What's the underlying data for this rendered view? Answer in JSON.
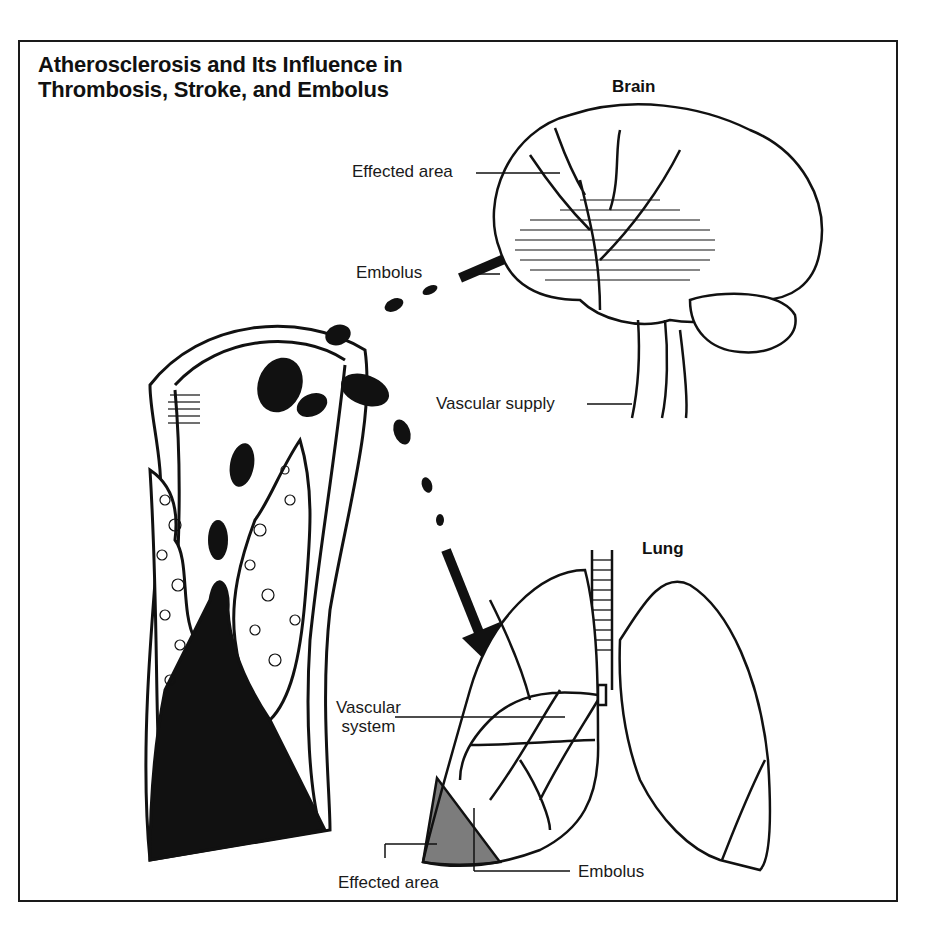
{
  "title": {
    "line1": "Atherosclerosis and Its Influence in",
    "line2": "Thrombosis, Stroke, and Embolus"
  },
  "brain": {
    "heading": "Brain",
    "labels": {
      "effected_area": "Effected area",
      "embolus": "Embolus",
      "vascular_supply": "Vascular supply"
    }
  },
  "lung": {
    "heading": "Lung",
    "labels": {
      "vascular_system_line1": "Vascular",
      "vascular_system_line2": "system",
      "effected_area": "Effected area",
      "embolus": "Embolus"
    }
  },
  "colors": {
    "ink": "#111111",
    "paper": "#ffffff"
  }
}
